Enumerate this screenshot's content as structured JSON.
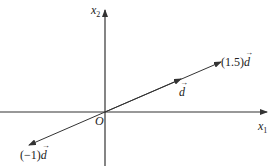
{
  "diagram": {
    "axes": {
      "x_label": "x",
      "x_sub": "1",
      "y_label": "x",
      "y_sub": "2",
      "origin_label": "O"
    },
    "vectors": [
      {
        "name": "d",
        "scale": "1",
        "label_prefix": "",
        "label_vec": "d"
      },
      {
        "name": "1.5d",
        "scale": "1.5",
        "label_prefix": "(1.5)",
        "label_vec": "d"
      },
      {
        "name": "-1d",
        "scale": "-1",
        "label_prefix": "(−1)",
        "label_vec": "d"
      }
    ],
    "colors": {
      "line": "#333333",
      "background": "#ffffff"
    }
  }
}
